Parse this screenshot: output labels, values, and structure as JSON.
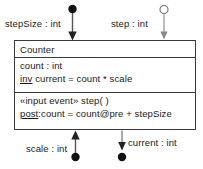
{
  "diagram": {
    "type": "uml-class-with-ports",
    "background_color": "#ffffff",
    "line_color": "#3a3a3a",
    "text_color": "#1a1a1a"
  },
  "class_box": {
    "name": "Counter",
    "attributes": [
      {
        "text": "count : int",
        "keyword": "",
        "rest": "count : int"
      },
      {
        "text": "inv current = count * scale",
        "keyword": "inv",
        "rest": " current = count * scale"
      }
    ],
    "operations": [
      {
        "text": "«input event» step( )",
        "keyword": "",
        "rest": "«input event» step( )"
      },
      {
        "text": "post:count = count@pre + stepSize",
        "keyword": "post",
        "rest": ":count = count@pre + stepSize"
      }
    ]
  },
  "ports": [
    {
      "id": "stepSize",
      "label": "stepSize : int",
      "marker": "filled-circle",
      "direction": "in",
      "position": "top-left"
    },
    {
      "id": "step",
      "label": "step : int",
      "marker": "hollow-circle",
      "direction": "in",
      "position": "top-right"
    },
    {
      "id": "scale",
      "label": "scale : int",
      "marker": "filled-circle",
      "direction": "in",
      "position": "bottom-left"
    },
    {
      "id": "current",
      "label": "current : int",
      "marker": "filled-circle",
      "direction": "out",
      "position": "bottom-right"
    }
  ]
}
